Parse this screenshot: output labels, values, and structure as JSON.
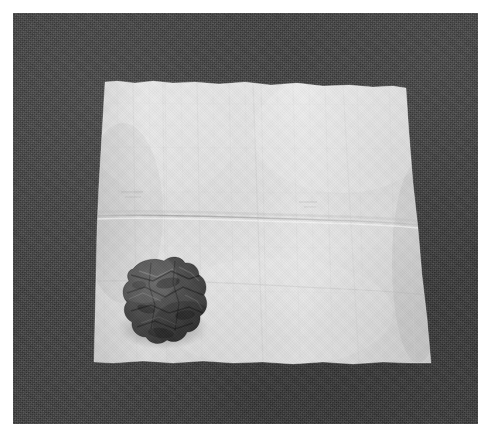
{
  "image": {
    "type": "photograph",
    "caption": "A light gray square paper napkin laid flat on a dark gray textured fabric surface, with a small dark crumpled lump of clay resting on its lower-left area.",
    "width_px": 492,
    "height_px": 438,
    "border": {
      "name": "white-photo-border",
      "color": "#ffffff",
      "left_px": 13,
      "top_px": 13,
      "right_px": 14,
      "bottom_px": 14
    }
  },
  "scene": {
    "background": {
      "label": "dark gray textured fabric backdrop",
      "color": "#3c3c3c",
      "highlight_color": "#4a4a4a",
      "shadow_color": "#2c2c2c"
    },
    "napkin": {
      "label": "light gray square paper napkin",
      "color": "#e3e3e3",
      "highlight_color": "#efefef",
      "shadow_color": "#c9c9c9",
      "crease_color": "#cfcfcf",
      "corners": {
        "top_left": [
          105,
          82
        ],
        "top_right": [
          406,
          88
        ],
        "bottom_right": [
          431,
          363
        ],
        "bottom_left": [
          94,
          361
        ]
      },
      "fold_line_y": 211,
      "fold_label": "horizontal center crease"
    },
    "object": {
      "label": "crumpled dark clay lump",
      "color": "#4a4a4a",
      "highlight_color": "#5e5e5e",
      "shadow_color": "#323232",
      "center": [
        146,
        295
      ],
      "width_px": 70,
      "height_px": 76
    }
  }
}
